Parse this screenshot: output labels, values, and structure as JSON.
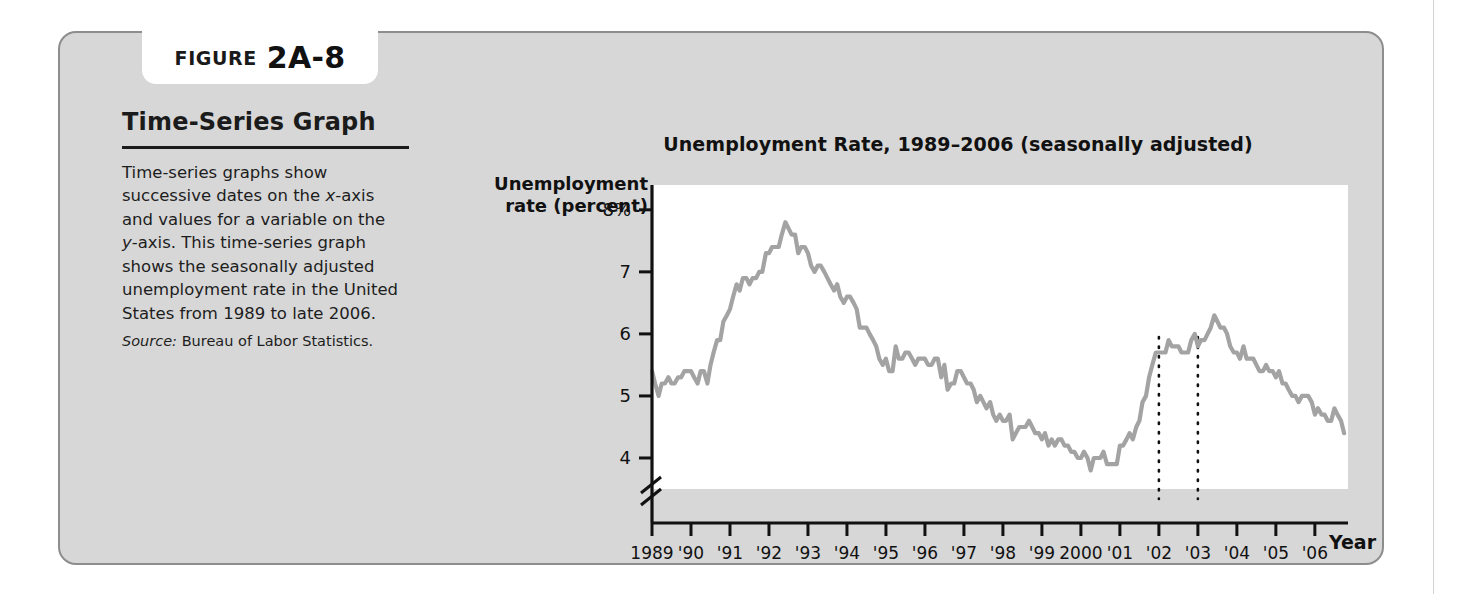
{
  "figure": {
    "label_word": "FIGURE",
    "number": "2A-8",
    "side_heading": "Time-Series Graph",
    "caption": "Time-series graphs show successive dates on the x-axis and values for a variable on the y-axis. This time-series graph shows the seasonally adjusted unemployment rate in the United States from 1989 to late 2006.",
    "source_label": "Source:",
    "source_text": "Bureau of Labor Statistics."
  },
  "colors": {
    "panel_background": "#d7d7d7",
    "panel_border": "#8d8d8d",
    "plot_background": "#ffffff",
    "series_line": "#a3a3a3",
    "axis": "#111111",
    "text": "#1b1b1b"
  },
  "chart_data": {
    "type": "line",
    "title": "Unemployment Rate, 1989–2006 (seasonally adjusted)",
    "ylabel": "Unemployment rate (percent)",
    "xlabel": "Year",
    "ylim": [
      3.5,
      8.4
    ],
    "y_ticks": [
      4,
      5,
      6,
      7,
      8
    ],
    "y_tick_labels": [
      "4",
      "5",
      "6",
      "7",
      "8%"
    ],
    "y_axis_break": true,
    "grid": false,
    "legend": "none",
    "x_ticks": [
      1989,
      1990,
      1991,
      1992,
      1993,
      1994,
      1995,
      1996,
      1997,
      1998,
      1999,
      2000,
      2001,
      2002,
      2003,
      2004,
      2005,
      2006
    ],
    "x_tick_labels": [
      "1989",
      "'90",
      "'91",
      "'92",
      "'93",
      "'94",
      "'95",
      "'96",
      "'97",
      "'98",
      "'99",
      "2000",
      "'01",
      "'02",
      "'03",
      "'04",
      "'05",
      "'06"
    ],
    "xlim": [
      1989,
      2006.85
    ],
    "annotations": [
      {
        "type": "vertical-dotted-line",
        "x": 2002.0,
        "label": "2002 marker"
      },
      {
        "type": "vertical-dotted-line",
        "x": 2003.0,
        "label": "2003 marker"
      }
    ],
    "series": [
      {
        "name": "Unemployment rate (percent)",
        "x": [
          1989.0,
          1989.08,
          1989.17,
          1989.25,
          1989.33,
          1989.42,
          1989.5,
          1989.58,
          1989.67,
          1989.75,
          1989.83,
          1989.92,
          1990.0,
          1990.08,
          1990.17,
          1990.25,
          1990.33,
          1990.42,
          1990.5,
          1990.58,
          1990.67,
          1990.75,
          1990.83,
          1990.92,
          1991.0,
          1991.08,
          1991.17,
          1991.25,
          1991.33,
          1991.42,
          1991.5,
          1991.58,
          1991.67,
          1991.75,
          1991.83,
          1991.92,
          1992.0,
          1992.08,
          1992.17,
          1992.25,
          1992.33,
          1992.42,
          1992.5,
          1992.58,
          1992.67,
          1992.75,
          1992.83,
          1992.92,
          1993.0,
          1993.08,
          1993.17,
          1993.25,
          1993.33,
          1993.42,
          1993.5,
          1993.58,
          1993.67,
          1993.75,
          1993.83,
          1993.92,
          1994.0,
          1994.08,
          1994.17,
          1994.25,
          1994.33,
          1994.42,
          1994.5,
          1994.58,
          1994.67,
          1994.75,
          1994.83,
          1994.92,
          1995.0,
          1995.08,
          1995.17,
          1995.25,
          1995.33,
          1995.42,
          1995.5,
          1995.58,
          1995.67,
          1995.75,
          1995.83,
          1995.92,
          1996.0,
          1996.08,
          1996.17,
          1996.25,
          1996.33,
          1996.42,
          1996.5,
          1996.58,
          1996.67,
          1996.75,
          1996.83,
          1996.92,
          1997.0,
          1997.08,
          1997.17,
          1997.25,
          1997.33,
          1997.42,
          1997.5,
          1997.58,
          1997.67,
          1997.75,
          1997.83,
          1997.92,
          1998.0,
          1998.08,
          1998.17,
          1998.25,
          1998.33,
          1998.42,
          1998.5,
          1998.58,
          1998.67,
          1998.75,
          1998.83,
          1998.92,
          1999.0,
          1999.08,
          1999.17,
          1999.25,
          1999.33,
          1999.42,
          1999.5,
          1999.58,
          1999.67,
          1999.75,
          1999.83,
          1999.92,
          2000.0,
          2000.08,
          2000.17,
          2000.25,
          2000.33,
          2000.42,
          2000.5,
          2000.58,
          2000.67,
          2000.75,
          2000.83,
          2000.92,
          2001.0,
          2001.08,
          2001.17,
          2001.25,
          2001.33,
          2001.42,
          2001.5,
          2001.58,
          2001.67,
          2001.75,
          2001.83,
          2001.92,
          2002.0,
          2002.08,
          2002.17,
          2002.25,
          2002.33,
          2002.42,
          2002.5,
          2002.58,
          2002.67,
          2002.75,
          2002.83,
          2002.92,
          2003.0,
          2003.08,
          2003.17,
          2003.25,
          2003.33,
          2003.42,
          2003.5,
          2003.58,
          2003.67,
          2003.75,
          2003.83,
          2003.92,
          2004.0,
          2004.08,
          2004.17,
          2004.25,
          2004.33,
          2004.42,
          2004.5,
          2004.58,
          2004.67,
          2004.75,
          2004.83,
          2004.92,
          2005.0,
          2005.08,
          2005.17,
          2005.25,
          2005.33,
          2005.42,
          2005.5,
          2005.58,
          2005.67,
          2005.75,
          2005.83,
          2005.92,
          2006.0,
          2006.08,
          2006.17,
          2006.25,
          2006.33,
          2006.42,
          2006.5,
          2006.58,
          2006.67,
          2006.75
        ],
        "values": [
          5.4,
          5.2,
          5.0,
          5.2,
          5.2,
          5.3,
          5.2,
          5.2,
          5.3,
          5.3,
          5.4,
          5.4,
          5.4,
          5.3,
          5.2,
          5.4,
          5.4,
          5.2,
          5.5,
          5.7,
          5.9,
          5.9,
          6.2,
          6.3,
          6.4,
          6.6,
          6.8,
          6.7,
          6.9,
          6.9,
          6.8,
          6.9,
          6.9,
          7.0,
          7.0,
          7.3,
          7.3,
          7.4,
          7.4,
          7.4,
          7.6,
          7.8,
          7.7,
          7.6,
          7.6,
          7.3,
          7.4,
          7.4,
          7.3,
          7.1,
          7.0,
          7.1,
          7.1,
          7.0,
          6.9,
          6.8,
          6.7,
          6.8,
          6.6,
          6.5,
          6.6,
          6.6,
          6.5,
          6.4,
          6.1,
          6.1,
          6.1,
          6.0,
          5.9,
          5.8,
          5.6,
          5.5,
          5.6,
          5.4,
          5.4,
          5.8,
          5.6,
          5.6,
          5.7,
          5.7,
          5.6,
          5.5,
          5.6,
          5.6,
          5.6,
          5.5,
          5.5,
          5.6,
          5.6,
          5.3,
          5.5,
          5.1,
          5.2,
          5.2,
          5.4,
          5.4,
          5.3,
          5.2,
          5.2,
          5.1,
          4.9,
          5.0,
          4.9,
          4.8,
          4.9,
          4.7,
          4.6,
          4.7,
          4.6,
          4.6,
          4.7,
          4.3,
          4.4,
          4.5,
          4.5,
          4.5,
          4.6,
          4.5,
          4.4,
          4.4,
          4.3,
          4.4,
          4.2,
          4.3,
          4.2,
          4.3,
          4.3,
          4.2,
          4.2,
          4.1,
          4.1,
          4.0,
          4.0,
          4.1,
          4.0,
          3.8,
          4.0,
          4.0,
          4.0,
          4.1,
          3.9,
          3.9,
          3.9,
          3.9,
          4.2,
          4.2,
          4.3,
          4.4,
          4.3,
          4.5,
          4.6,
          4.9,
          5.0,
          5.3,
          5.5,
          5.7,
          5.7,
          5.7,
          5.7,
          5.9,
          5.8,
          5.8,
          5.8,
          5.7,
          5.7,
          5.7,
          5.9,
          6.0,
          5.8,
          5.9,
          5.9,
          6.0,
          6.1,
          6.3,
          6.2,
          6.1,
          6.1,
          6.0,
          5.8,
          5.7,
          5.7,
          5.6,
          5.8,
          5.6,
          5.6,
          5.6,
          5.5,
          5.4,
          5.4,
          5.5,
          5.4,
          5.4,
          5.3,
          5.4,
          5.2,
          5.2,
          5.1,
          5.0,
          5.0,
          4.9,
          5.0,
          5.0,
          5.0,
          4.9,
          4.7,
          4.8,
          4.7,
          4.7,
          4.6,
          4.6,
          4.8,
          4.7,
          4.6,
          4.4
        ]
      }
    ]
  }
}
